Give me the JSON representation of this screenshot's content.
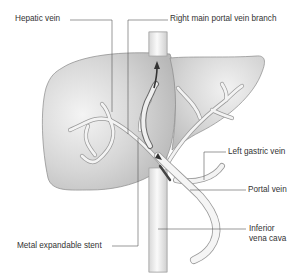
{
  "diagram": {
    "labels": [
      {
        "id": "hepatic-vein",
        "text": "Hepatic vein"
      },
      {
        "id": "right-main-portal-vein-branch",
        "text": "Right main portal vein branch"
      },
      {
        "id": "left-gastric-vein",
        "text": "Left gastric vein"
      },
      {
        "id": "portal-vein",
        "text": "Portal vein"
      },
      {
        "id": "inferior-vena-cava-line1",
        "text": "Inferior"
      },
      {
        "id": "inferior-vena-cava-line2",
        "text": "vena cava"
      },
      {
        "id": "metal-expandable-stent",
        "text": "Metal expandable stent"
      }
    ],
    "colors": {
      "liver_fill": "#c8c8c8",
      "liver_highlight": "#ececec",
      "liver_outline": "#8a8a8a",
      "vessel_fill": "#f2f2f2",
      "vessel_outline": "#9a9a9a",
      "stent": "#555555",
      "leader_line": "#555555",
      "label_text": "#333333"
    }
  }
}
